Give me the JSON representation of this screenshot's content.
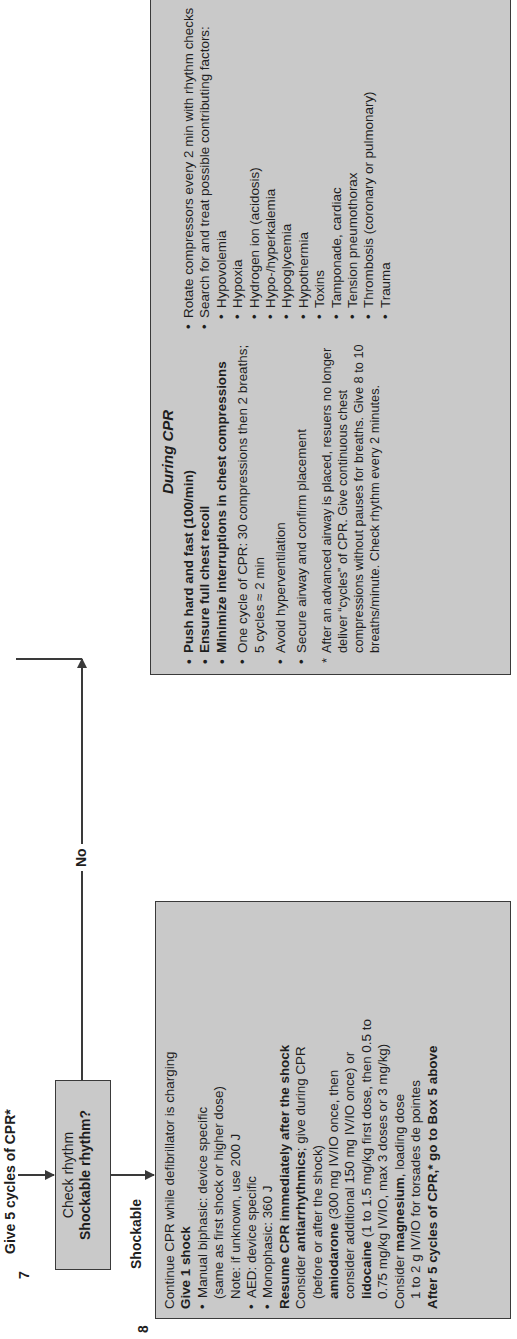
{
  "flow": {
    "top_label": "Give 5 cycles of CPR*",
    "no_label": "No",
    "shockable_label": "Shockable",
    "box7": {
      "number": "7",
      "line1": "Check rhythm",
      "line2": "Shockable rhythm?"
    },
    "box8": {
      "number": "8",
      "lines": [
        {
          "text": "Continue CPR while defibrillator is charging",
          "style": "normal"
        },
        {
          "text": "Give 1 shock",
          "style": "bold"
        },
        {
          "text": "Manual biphasic: device specific",
          "style": "bullet"
        },
        {
          "text": "(same as first shock or higher dose)",
          "style": "indent"
        },
        {
          "text": "Note: if unknown, use 200 J",
          "style": "indent"
        },
        {
          "text": "AED: device specific",
          "style": "bullet"
        },
        {
          "text": "Monophasic: 360 J",
          "style": "bullet"
        },
        {
          "text": "Resume CPR immediately after the shock",
          "style": "bold"
        }
      ],
      "antiarrhythmics": {
        "prefix": "Consider ",
        "bold": "antiarrhythmics",
        "suffix": "; give during CPR",
        "line2": "(before or after the shock)"
      },
      "amiodarone": {
        "bold": "amiodarone",
        "text": " (300 mg IV/IO once, then",
        "line2": "consider additional 150 mg IV/IO once) or"
      },
      "lidocaine": {
        "bold": "lidocaine",
        "text": " (1 to 1.5 mg/kg first dose, then 0.5 to",
        "line2": "0.75 mg/kg IV/IO, max 3 doses or 3 mg/kg)"
      },
      "magnesium": {
        "prefix": "Consider ",
        "bold": "magnesium",
        "suffix": ", loading dose",
        "line2": "1 to 2 g IV/IO for torsades de pointes"
      },
      "final": "After 5 cycles of CPR,* go to Box 5 above"
    },
    "during_cpr": {
      "title": "During CPR",
      "left_bullets": [
        {
          "text": "Push hard and fast (100/min)",
          "bold": true
        },
        {
          "text": "Ensure full chest recoil",
          "bold": true
        },
        {
          "text": "Minimize interruptions in chest compressions",
          "bold": true
        },
        {
          "text": "One cycle of CPR: 30 compressions then 2 breaths; 5 cycles ≈ 2 min",
          "bold": false
        },
        {
          "text": "Avoid hyperventilation",
          "bold": false
        },
        {
          "text": "Secure airway and confirm placement",
          "bold": false
        }
      ],
      "note": "After an advanced airway is placed, resuers no longer deliver “cycles” of CPR. Give continuous chest compressions without pauses for breaths. Give 8 to 10 breaths/minute. Check rhythm every 2 minutes.",
      "right_bullets": [
        "Rotate compressors every 2 min with rhythm checks",
        "Search for and treat possible contributing factors:"
      ],
      "factors": [
        "Hypovolemia",
        "Hypoxia",
        "Hydrogen ion (acidosis)",
        "Hypo-/hyperkalemia",
        "Hypoglycemia",
        "Hypothermia",
        "Toxins",
        "Tamponade, cardiac",
        "Tension pneumothorax",
        "Thrombosis (coronary or pulmonary)",
        "Trauma"
      ]
    }
  },
  "colors": {
    "box_fill": "#c9c9c9",
    "line": "#3a3a3a",
    "text": "#1e1e1e"
  }
}
